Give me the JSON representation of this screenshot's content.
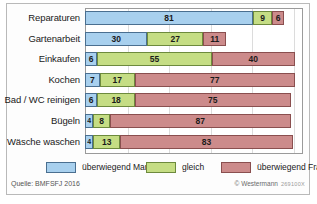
{
  "chart_data": {
    "type": "bar",
    "orientation": "horizontal",
    "stacked": true,
    "title": "",
    "xlabel": "",
    "ylabel": "",
    "xlim": [
      0,
      105
    ],
    "grid": true,
    "legend_position": "bottom",
    "categories": [
      "Reparaturen",
      "Gartenarbeit",
      "Einkaufen",
      "Kochen",
      "Bad / WC reinigen",
      "Bügeln",
      "Wäsche waschen"
    ],
    "series": [
      {
        "name": "überwiegend Mann",
        "color": "#a8d0ee",
        "values": [
          81,
          30,
          6,
          7,
          6,
          4,
          4
        ]
      },
      {
        "name": "gleich",
        "color": "#c5dd84",
        "values": [
          9,
          27,
          55,
          17,
          18,
          8,
          13
        ]
      },
      {
        "name": "überwiegend Frau",
        "color": "#cc8b8b",
        "values": [
          6,
          11,
          40,
          77,
          75,
          87,
          83
        ]
      }
    ],
    "gridline_values": [
      20,
      40,
      60,
      80,
      100
    ]
  },
  "legend": {
    "items": [
      {
        "label": "überwiegend Mann",
        "color": "#a8d0ee"
      },
      {
        "label": "gleich",
        "color": "#c5dd84"
      },
      {
        "label": "überwiegend Frau",
        "color": "#cc8b8b"
      }
    ]
  },
  "footer": {
    "source": "Quelle: BMFSFJ 2016",
    "credit": "© Westermann",
    "credit_code": "269100X"
  }
}
